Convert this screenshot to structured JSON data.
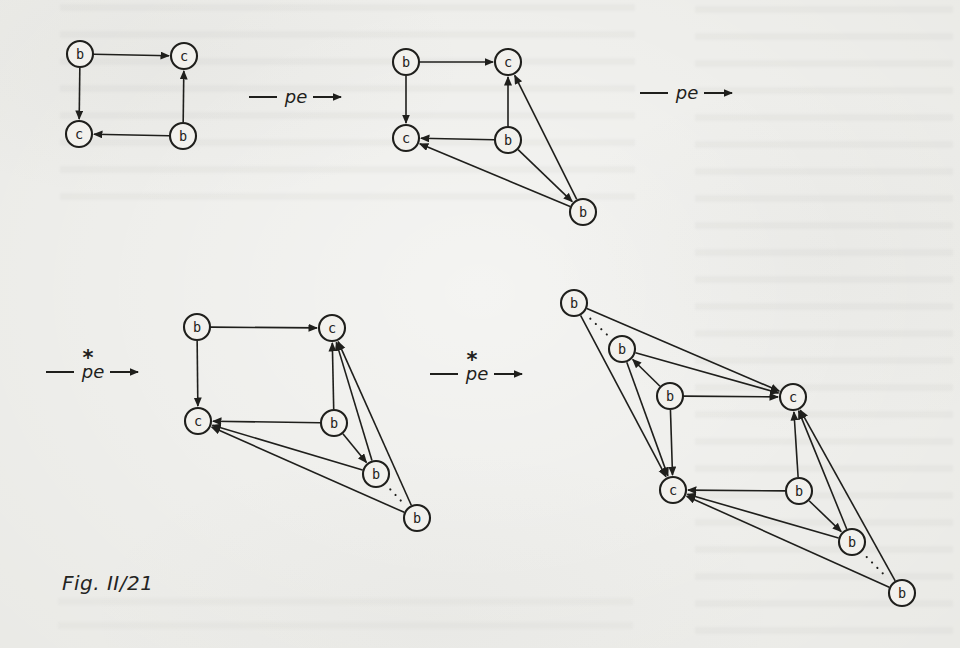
{
  "figure": {
    "caption": "Fig. II/21",
    "ink_color": "#1f1f1c",
    "paper_color": "#e9e9e5",
    "node_fill": "#f2f1ed",
    "node_radius": 13
  },
  "transitions": [
    {
      "label": "pe",
      "star": "",
      "x": 296,
      "y": 97
    },
    {
      "label": "pe",
      "star": "",
      "x": 687,
      "y": 93
    },
    {
      "label": "pe",
      "star": "*",
      "x": 93,
      "y": 372
    },
    {
      "label": "pe",
      "star": "*",
      "x": 477,
      "y": 374
    }
  ],
  "graphs": [
    {
      "id": "step-1",
      "nodes": [
        {
          "id": "b1",
          "label": "b",
          "x": 80,
          "y": 54
        },
        {
          "id": "c1",
          "label": "c",
          "x": 184,
          "y": 56
        },
        {
          "id": "c2",
          "label": "c",
          "x": 79,
          "y": 134
        },
        {
          "id": "b2",
          "label": "b",
          "x": 183,
          "y": 136
        }
      ],
      "edges": [
        {
          "from": "b1",
          "to": "c1"
        },
        {
          "from": "b1",
          "to": "c2"
        },
        {
          "from": "b2",
          "to": "c1"
        },
        {
          "from": "b2",
          "to": "c2"
        }
      ]
    },
    {
      "id": "step-2",
      "nodes": [
        {
          "id": "b1",
          "label": "b",
          "x": 406,
          "y": 62
        },
        {
          "id": "c1",
          "label": "c",
          "x": 508,
          "y": 62
        },
        {
          "id": "c2",
          "label": "c",
          "x": 406,
          "y": 138
        },
        {
          "id": "b2",
          "label": "b",
          "x": 508,
          "y": 140
        },
        {
          "id": "b3",
          "label": "b",
          "x": 583,
          "y": 212
        }
      ],
      "edges": [
        {
          "from": "b1",
          "to": "c1"
        },
        {
          "from": "b1",
          "to": "c2"
        },
        {
          "from": "b2",
          "to": "c1"
        },
        {
          "from": "b2",
          "to": "c2"
        },
        {
          "from": "b2",
          "to": "b3"
        },
        {
          "from": "b3",
          "to": "c1"
        },
        {
          "from": "b3",
          "to": "c2"
        }
      ]
    },
    {
      "id": "step-3",
      "nodes": [
        {
          "id": "b1",
          "label": "b",
          "x": 197,
          "y": 327
        },
        {
          "id": "c1",
          "label": "c",
          "x": 332,
          "y": 328
        },
        {
          "id": "c2",
          "label": "c",
          "x": 198,
          "y": 421
        },
        {
          "id": "b2",
          "label": "b",
          "x": 334,
          "y": 423
        },
        {
          "id": "b3",
          "label": "b",
          "x": 376,
          "y": 474
        },
        {
          "id": "b4",
          "label": "b",
          "x": 417,
          "y": 518
        }
      ],
      "edges": [
        {
          "from": "b1",
          "to": "c1"
        },
        {
          "from": "b1",
          "to": "c2"
        },
        {
          "from": "b2",
          "to": "c1"
        },
        {
          "from": "b2",
          "to": "c2"
        },
        {
          "from": "b2",
          "to": "b3"
        },
        {
          "from": "b3",
          "to": "c1"
        },
        {
          "from": "b3",
          "to": "c2"
        },
        {
          "from": "b4",
          "to": "c1"
        },
        {
          "from": "b4",
          "to": "c2"
        },
        {
          "from": "b3",
          "to": "b4",
          "style": "dotted"
        }
      ]
    },
    {
      "id": "step-4",
      "nodes": [
        {
          "id": "b5",
          "label": "b",
          "x": 574,
          "y": 303
        },
        {
          "id": "b4",
          "label": "b",
          "x": 622,
          "y": 349
        },
        {
          "id": "b1",
          "label": "b",
          "x": 670,
          "y": 396
        },
        {
          "id": "c1",
          "label": "c",
          "x": 793,
          "y": 397
        },
        {
          "id": "c2",
          "label": "c",
          "x": 673,
          "y": 490
        },
        {
          "id": "b2",
          "label": "b",
          "x": 799,
          "y": 491
        },
        {
          "id": "b3",
          "label": "b",
          "x": 852,
          "y": 542
        },
        {
          "id": "b6",
          "label": "b",
          "x": 902,
          "y": 593
        }
      ],
      "edges": [
        {
          "from": "b1",
          "to": "c1"
        },
        {
          "from": "b1",
          "to": "c2"
        },
        {
          "from": "b2",
          "to": "c1"
        },
        {
          "from": "b2",
          "to": "c2"
        },
        {
          "from": "b1",
          "to": "b4"
        },
        {
          "from": "b4",
          "to": "c1"
        },
        {
          "from": "b4",
          "to": "c2"
        },
        {
          "from": "b5",
          "to": "c1"
        },
        {
          "from": "b5",
          "to": "c2"
        },
        {
          "from": "b4",
          "to": "b5",
          "style": "dotted"
        },
        {
          "from": "b2",
          "to": "b3"
        },
        {
          "from": "b3",
          "to": "c1"
        },
        {
          "from": "b3",
          "to": "c2"
        },
        {
          "from": "b6",
          "to": "c1"
        },
        {
          "from": "b6",
          "to": "c2"
        },
        {
          "from": "b3",
          "to": "b6",
          "style": "dotted"
        }
      ]
    }
  ]
}
